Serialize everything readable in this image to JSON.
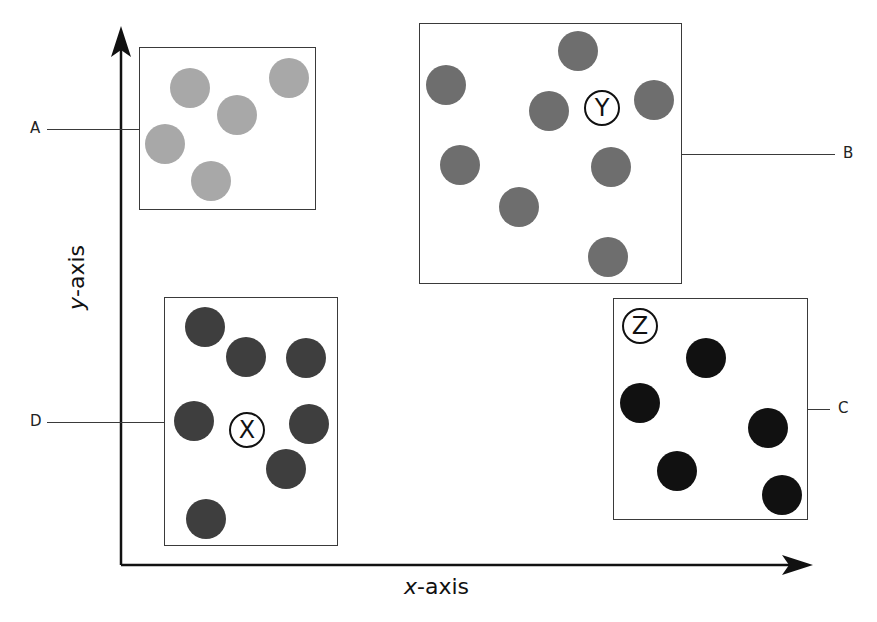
{
  "diagram": {
    "axes": {
      "x_label_var": "x",
      "x_label_rest": "-axis",
      "y_label_var": "y",
      "y_label_rest": "-axis"
    },
    "groups": [
      {
        "id": "A",
        "callout": "A",
        "callout_side": "left",
        "marker": "",
        "color": "#a8a8a8",
        "box": {
          "x": 139,
          "y": 47,
          "w": 177,
          "h": 163
        },
        "dots": [
          [
            190,
            88
          ],
          [
            289,
            78
          ],
          [
            237,
            115
          ],
          [
            165,
            144
          ],
          [
            211,
            181
          ]
        ]
      },
      {
        "id": "B",
        "callout": "B",
        "callout_side": "right",
        "marker": "Y",
        "marker_pos": [
          602,
          108
        ],
        "color": "#6e6e6e",
        "box": {
          "x": 419,
          "y": 23,
          "w": 263,
          "h": 261
        },
        "dots": [
          [
            578,
            51
          ],
          [
            446,
            85
          ],
          [
            549,
            111
          ],
          [
            654,
            100
          ],
          [
            460,
            165
          ],
          [
            611,
            167
          ],
          [
            519,
            207
          ],
          [
            608,
            257
          ]
        ]
      },
      {
        "id": "C",
        "callout": "C",
        "callout_side": "right",
        "marker": "Z",
        "marker_pos": [
          640,
          326
        ],
        "color": "#111111",
        "box": {
          "x": 613,
          "y": 298,
          "w": 195,
          "h": 222
        },
        "dots": [
          [
            706,
            358
          ],
          [
            640,
            403
          ],
          [
            768,
            428
          ],
          [
            677,
            471
          ],
          [
            782,
            495
          ]
        ]
      },
      {
        "id": "D",
        "callout": "D",
        "callout_side": "left",
        "marker": "X",
        "marker_pos": [
          247,
          430
        ],
        "color": "#3e3e3e",
        "box": {
          "x": 164,
          "y": 297,
          "w": 174,
          "h": 249
        },
        "dots": [
          [
            205,
            327
          ],
          [
            246,
            357
          ],
          [
            306,
            358
          ],
          [
            194,
            421
          ],
          [
            309,
            424
          ],
          [
            286,
            469
          ],
          [
            206,
            519
          ]
        ]
      }
    ]
  }
}
